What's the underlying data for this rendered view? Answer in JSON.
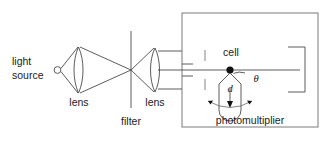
{
  "figure": {
    "kind": "optical-apparatus-schematic",
    "width": 329,
    "height": 145,
    "background_color": "#ffffff",
    "line_color": "#4a4a4a",
    "text_color": "#1a1a1a"
  },
  "labels": {
    "light_source_line1": "light",
    "light_source_line2": "source",
    "lens_first": "lens",
    "lens_second": "lens",
    "filter": "filter",
    "cell": "cell",
    "theta": "θ",
    "distance": "d",
    "photomultiplier": "photomultiplier"
  },
  "components": [
    {
      "name": "light-source",
      "label": "light source",
      "shape": "small-circle",
      "x": 57,
      "y": 70
    },
    {
      "name": "lens-first",
      "label": "lens",
      "shape": "biconvex-lens",
      "x": 79,
      "y": 70
    },
    {
      "name": "filter",
      "label": "filter",
      "shape": "vertical-line",
      "x": 131,
      "y": 70
    },
    {
      "name": "lens-second",
      "label": "lens",
      "shape": "biconvex-lens",
      "x": 155,
      "y": 70
    },
    {
      "name": "sample-cell",
      "label": "cell",
      "shape": "filled-dot",
      "x": 230,
      "y": 70
    },
    {
      "name": "photomultiplier",
      "label": "photomultiplier",
      "shape": "tube",
      "x": 230,
      "y": 100
    },
    {
      "name": "beam-stop",
      "label": "",
      "shape": "open-rectangle",
      "x": 300,
      "y": 70
    },
    {
      "name": "enclosure",
      "label": "",
      "shape": "rectangle",
      "x": 250,
      "y": 70
    }
  ],
  "annotations": {
    "scattering_angle_symbol": "θ",
    "detector_distance_symbol": "d",
    "rotation_indicator": "double-headed-arc-arrow"
  }
}
